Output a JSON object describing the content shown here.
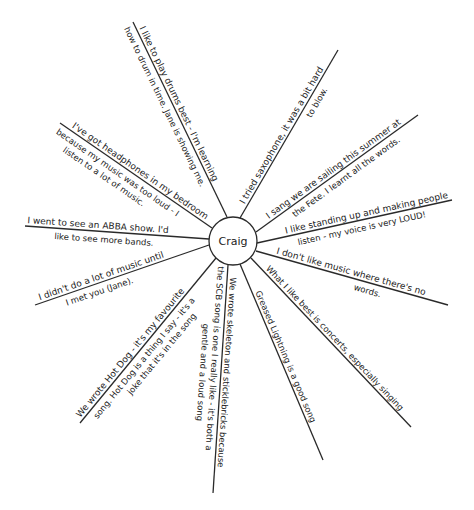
{
  "diagram": {
    "type": "spider-diagram",
    "center": {
      "label": "Craig",
      "cx": 233,
      "cy": 241,
      "r": 24
    },
    "stroke_color": "#2a2a2a",
    "background": "#ffffff",
    "spokes": [
      {
        "id": "drums",
        "line": [
          227,
          217,
          133,
          22
        ],
        "text_above": "I like to play drums best - I'm learning",
        "text_below": "how to drum in time. Jane is showing me."
      },
      {
        "id": "saxophone",
        "line": [
          240,
          218,
          338,
          50
        ],
        "text_above": "I tried saxophone, it was a bit hard",
        "text_below": "to blow."
      },
      {
        "id": "fete",
        "line": [
          256,
          232,
          418,
          115
        ],
        "text_above": "I sang we are sailing this summer at",
        "text_below": "the Fete. I learnt all the words."
      },
      {
        "id": "loud",
        "line": [
          257,
          243,
          452,
          200
        ],
        "text_above": "I like standing up and making people",
        "text_below": "listen - my voice is very LOUD!"
      },
      {
        "id": "words",
        "line": [
          256,
          251,
          448,
          305
        ],
        "text_above": "I don't like music where there's no",
        "text_below": "words."
      },
      {
        "id": "concerts",
        "line": [
          251,
          258,
          411,
          427
        ],
        "text_above": "What I like best is concerts, especially singing",
        "text_below": ""
      },
      {
        "id": "greased-lightning",
        "line": [
          240,
          264,
          323,
          460
        ],
        "text_above": "Greased Lightning is a good song",
        "text_below": ""
      },
      {
        "id": "skeleton",
        "line": [
          228,
          265,
          213,
          493
        ],
        "text_above": "We wrote skeleton and sticklebricks because",
        "text_below": "the SCB song is one I really like - it's both a",
        "text_below_2": "gentle and a loud song"
      },
      {
        "id": "hot-dog",
        "line": [
          216,
          258,
          80,
          423
        ],
        "text_above": "We wrote Hot Dog - it's my favourite",
        "text_below": "song. Hot Dog is a thing I say - it's a",
        "text_below_2": "joke that it's in the song"
      },
      {
        "id": "until-you",
        "line": [
          209,
          245,
          35,
          305
        ],
        "text_above": "I didn't do a lot of music until",
        "text_below": "I met you (Jane)."
      },
      {
        "id": "abba",
        "line": [
          209,
          239,
          25,
          226
        ],
        "text_above": "I went to see an ABBA show. I'd",
        "text_below": "like to see more bands."
      },
      {
        "id": "headphones",
        "line": [
          212,
          228,
          60,
          123
        ],
        "text_above": "I've got headphones in my bedroom",
        "text_below": "because my music was too loud - I",
        "text_below_2": "listen to a lot of music."
      }
    ]
  }
}
